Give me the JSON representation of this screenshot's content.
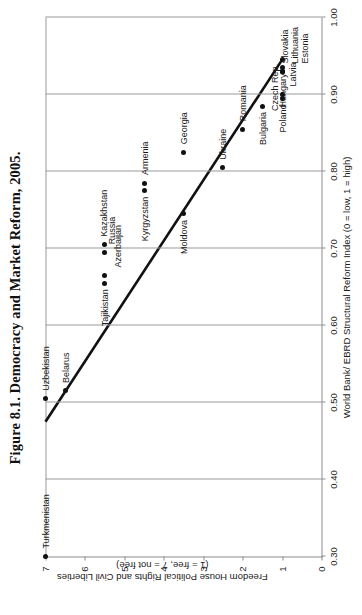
{
  "figure": {
    "title": "Figure 8.1. Democracy and Market Reform, 2005."
  },
  "chart_data": {
    "type": "scatter",
    "title": "Figure 8.1. Democracy and Market Reform, 2005.",
    "xlabel": "World Bank/ EBRD Structural Reform Index (0 = low, 1 = high)",
    "ylabel": "Freedom House Political Rights and Civil Liberties (1 = free, 7 = not free)",
    "ylabel_line1": "Freedom House Political Rights and Civil Liberties",
    "ylabel_line2": "(1 = free, 7 = not free)",
    "xlim": [
      0.3,
      1.0
    ],
    "ylim": [
      0,
      7
    ],
    "y_inverted": true,
    "grid": "vertical",
    "legend": "none",
    "xticks": [
      "0.30",
      "0.40",
      "0.50",
      "0.60",
      "0.70",
      "0.80",
      "0.90",
      "1.00"
    ],
    "xtick_values": [
      0.3,
      0.4,
      0.5,
      0.6,
      0.7,
      0.8,
      0.9,
      1.0
    ],
    "yticks": [
      "0",
      "1",
      "2",
      "3",
      "4",
      "5",
      "6",
      "7"
    ],
    "ytick_values": [
      0,
      1,
      2,
      3,
      4,
      5,
      6,
      7
    ],
    "points": [
      {
        "name": "Turkmenistan",
        "x": 0.3,
        "y": 7.0,
        "lx": 8,
        "ly": -4,
        "anchor": "left"
      },
      {
        "name": "Uzbekistan",
        "x": 0.505,
        "y": 7.0,
        "lx": 8,
        "ly": -4,
        "anchor": "left"
      },
      {
        "name": "Belarus",
        "x": 0.515,
        "y": 6.5,
        "lx": 8,
        "ly": -4,
        "anchor": "left"
      },
      {
        "name": "Tajikistan",
        "x": 0.655,
        "y": 5.5,
        "lx": -6,
        "ly": -4,
        "anchor": "right"
      },
      {
        "name": "Azerbaijan",
        "x": 0.665,
        "y": 5.5,
        "lx": 8,
        "ly": 9,
        "anchor": "left"
      },
      {
        "name": "Russia",
        "x": 0.695,
        "y": 5.5,
        "lx": 8,
        "ly": 3,
        "anchor": "left"
      },
      {
        "name": "Kazakhstan",
        "x": 0.705,
        "y": 5.5,
        "lx": 8,
        "ly": -5,
        "anchor": "left"
      },
      {
        "name": "Kyrgyzstan",
        "x": 0.775,
        "y": 4.5,
        "lx": -6,
        "ly": -4,
        "anchor": "right"
      },
      {
        "name": "Armenia",
        "x": 0.785,
        "y": 4.5,
        "lx": 8,
        "ly": -4,
        "anchor": "left"
      },
      {
        "name": "Moldova",
        "x": 0.745,
        "y": 3.5,
        "lx": -6,
        "ly": -4,
        "anchor": "right"
      },
      {
        "name": "Georgia",
        "x": 0.825,
        "y": 3.5,
        "lx": 8,
        "ly": -4,
        "anchor": "left"
      },
      {
        "name": "Ukraine",
        "x": 0.805,
        "y": 2.5,
        "lx": 8,
        "ly": -4,
        "anchor": "left"
      },
      {
        "name": "Romania",
        "x": 0.855,
        "y": 2.0,
        "lx": 8,
        "ly": -4,
        "anchor": "left"
      },
      {
        "name": "Bulgaria",
        "x": 0.885,
        "y": 1.5,
        "lx": -6,
        "ly": -4,
        "anchor": "right"
      },
      {
        "name": "Czech Rep.",
        "x": 0.945,
        "y": 1.0,
        "lx": -4,
        "ly": -12,
        "anchor": "right"
      },
      {
        "name": "Hungary",
        "x": 0.935,
        "y": 1.0,
        "lx": -6,
        "ly": -4,
        "anchor": "right"
      },
      {
        "name": "Slovakia",
        "x": 0.93,
        "y": 1.0,
        "lx": 8,
        "ly": -2,
        "anchor": "left"
      },
      {
        "name": "Lithuania",
        "x": 0.93,
        "y": 1.0,
        "lx": 8,
        "ly": 8,
        "anchor": "left"
      },
      {
        "name": "Estonia",
        "x": 0.93,
        "y": 1.0,
        "lx": 8,
        "ly": 18,
        "anchor": "left"
      },
      {
        "name": "Poland",
        "x": 0.895,
        "y": 1.0,
        "lx": -6,
        "ly": -4,
        "anchor": "right"
      },
      {
        "name": "Latvia",
        "x": 0.9,
        "y": 1.0,
        "lx": 8,
        "ly": 6,
        "anchor": "left"
      }
    ],
    "trendline": {
      "x0": 0.475,
      "y0": 7.0,
      "x1": 0.945,
      "y1": 1.0,
      "description": "linear fit, negative slope"
    }
  }
}
